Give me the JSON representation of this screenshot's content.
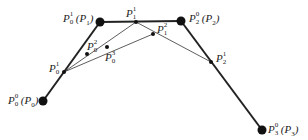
{
  "diagram": {
    "type": "de Casteljau construction (cubic Bezier)",
    "colors": {
      "line": "#222222",
      "dot": "#111111",
      "background": "#ffffff"
    },
    "control_points": [
      {
        "id": "P0",
        "x": 43,
        "y": 101,
        "label": {
          "base": "P",
          "sup": "0",
          "sub": "0",
          "paren": "(P",
          "paren_sub": "0",
          "close": ")"
        }
      },
      {
        "id": "P1",
        "x": 100,
        "y": 22,
        "label": {
          "base": "P",
          "sup": "1",
          "sub": "0",
          "paren": "(P",
          "paren_sub": "1",
          "close": ")"
        }
      },
      {
        "id": "P2",
        "x": 181,
        "y": 21,
        "label": {
          "base": "P",
          "sup": "0",
          "sub": "2",
          "paren": "(P",
          "paren_sub": "2",
          "close": ")"
        }
      },
      {
        "id": "P3",
        "x": 262,
        "y": 130,
        "label": {
          "base": "P",
          "sup": "0",
          "sub": "3",
          "paren": "(P",
          "paren_sub": "3",
          "close": ")"
        }
      }
    ],
    "intermediate_points": [
      {
        "id": "P01",
        "x": 64,
        "y": 72,
        "label": {
          "base": "P",
          "sup": "1",
          "sub": "0"
        }
      },
      {
        "id": "P11",
        "x": 136,
        "y": 22,
        "label": {
          "base": "P",
          "sup": "1",
          "sub": "1"
        }
      },
      {
        "id": "P21",
        "x": 211,
        "y": 62,
        "label": {
          "base": "P",
          "sup": "1",
          "sub": "2"
        }
      },
      {
        "id": "P02",
        "x": 87,
        "y": 54,
        "label": {
          "base": "P",
          "sup": "2",
          "sub": "0"
        }
      },
      {
        "id": "P12",
        "x": 153,
        "y": 34,
        "label": {
          "base": "P",
          "sup": "2",
          "sub": "1"
        }
      },
      {
        "id": "P03",
        "x": 107,
        "y": 47,
        "label": {
          "base": "P",
          "sup": "3",
          "sub": "0"
        }
      }
    ]
  }
}
